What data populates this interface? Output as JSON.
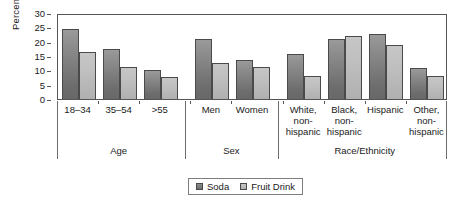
{
  "chart_data": {
    "type": "bar",
    "title": "",
    "subtitle": "",
    "xlabel": "",
    "ylabel": "Percent",
    "ylim": [
      0,
      30
    ],
    "yticks": [
      0,
      5,
      10,
      15,
      20,
      25,
      30
    ],
    "grid": false,
    "legend_position": "bottom-center",
    "categories": [
      "18–34",
      "35–54",
      ">55",
      "Men",
      "Women",
      "White, non-hispanic",
      "Black, non-hispanic",
      "Hispanic",
      "Other, non-hispanic"
    ],
    "series": [
      {
        "name": "Soda",
        "color": "#7b7b7b",
        "values": [
          24.5,
          17.5,
          10.2,
          21.0,
          13.5,
          15.7,
          21.0,
          22.7,
          10.7
        ]
      },
      {
        "name": "Fruit Drink",
        "color": "#bdbdbd",
        "values": [
          16.5,
          11.0,
          7.8,
          12.4,
          11.0,
          8.2,
          22.0,
          18.7,
          8.2
        ]
      }
    ],
    "groups": [
      {
        "label": "Age",
        "categories": [
          {
            "lines": [
              "18–34"
            ]
          },
          {
            "lines": [
              "35–54"
            ]
          },
          {
            "lines": [
              ">55"
            ]
          }
        ]
      },
      {
        "label": "Sex",
        "categories": [
          {
            "lines": [
              "Men"
            ]
          },
          {
            "lines": [
              "Women"
            ]
          }
        ]
      },
      {
        "label": "Race/Ethnicity",
        "categories": [
          {
            "lines": [
              "White,",
              "non-",
              "hispanic"
            ]
          },
          {
            "lines": [
              "Black,",
              "non-",
              "hispanic"
            ]
          },
          {
            "lines": [
              "Hispanic"
            ]
          },
          {
            "lines": [
              "Other,",
              "non-",
              "hispanic"
            ]
          }
        ]
      }
    ],
    "legend": [
      {
        "label": "Soda",
        "swatch": "soda"
      },
      {
        "label": "Fruit Drink",
        "swatch": "fruit"
      }
    ]
  }
}
